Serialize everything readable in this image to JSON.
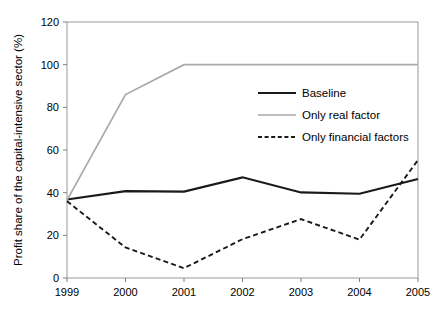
{
  "chart_data": {
    "type": "line",
    "title": "",
    "xlabel": "",
    "ylabel": "Profit share of the capital-intensive sector (%)",
    "categories": [
      "1999",
      "2000",
      "2001",
      "2002",
      "2003",
      "2004",
      "2005"
    ],
    "x": [
      1999,
      2000,
      2001,
      2002,
      2003,
      2004,
      2005
    ],
    "xlim": [
      1999,
      2005
    ],
    "ylim": [
      0,
      120
    ],
    "yticks": [
      0,
      20,
      40,
      60,
      80,
      100,
      120
    ],
    "xticks": [
      "1999",
      "2000",
      "2001",
      "2002",
      "2003",
      "2004",
      "2005"
    ],
    "grid": false,
    "legend_position": "upper-right-inside",
    "series": [
      {
        "name": "Baseline",
        "style": "solid",
        "color": "#1a1a1a",
        "width": 2.2,
        "values": [
          36.8,
          40.7,
          40.5,
          47.2,
          40.1,
          39.5,
          46.4
        ]
      },
      {
        "name": "Only real factor",
        "style": "solid",
        "color": "#a9a9a9",
        "width": 1.7,
        "values": [
          36.5,
          86.0,
          100.0,
          100.0,
          100.0,
          100.0,
          100.0
        ]
      },
      {
        "name": "Only financial factors",
        "style": "dashed",
        "color": "#1a1a1a",
        "width": 1.9,
        "values": [
          36.0,
          14.3,
          4.6,
          18.2,
          27.6,
          18.0,
          55.3
        ]
      }
    ]
  },
  "axes": {
    "y_title": "Profit share of the capital-intensive sector (%)",
    "y_tick_labels": [
      "0",
      "20",
      "40",
      "60",
      "80",
      "100",
      "120"
    ],
    "x_tick_labels": [
      "1999",
      "2000",
      "2001",
      "2002",
      "2003",
      "2004",
      "2005"
    ]
  },
  "legend": {
    "items": [
      {
        "label": "Baseline",
        "style": "solid",
        "color": "#1a1a1a"
      },
      {
        "label": "Only real factor",
        "style": "solid",
        "color": "#a9a9a9"
      },
      {
        "label": "Only financial factors",
        "style": "dashed",
        "color": "#1a1a1a"
      }
    ]
  },
  "colors": {
    "baseline": "#1a1a1a",
    "real_factor": "#a9a9a9",
    "financial_factors": "#1a1a1a",
    "axis": "#808080",
    "background": "#ffffff"
  }
}
